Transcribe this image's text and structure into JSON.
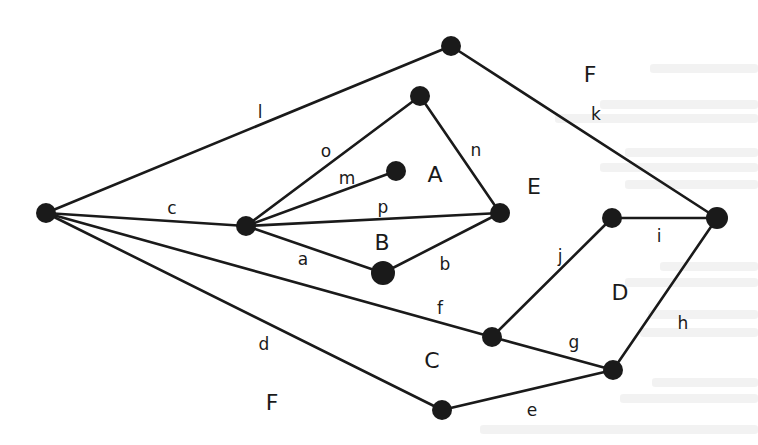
{
  "diagram": {
    "type": "planar-graph",
    "nodes": [
      {
        "id": "N1",
        "x": 46,
        "y": 213,
        "r": 10
      },
      {
        "id": "N2",
        "x": 246,
        "y": 226,
        "r": 10
      },
      {
        "id": "N3",
        "x": 451,
        "y": 46,
        "r": 10
      },
      {
        "id": "N4",
        "x": 420,
        "y": 96,
        "r": 10
      },
      {
        "id": "N5",
        "x": 396,
        "y": 171,
        "r": 10
      },
      {
        "id": "N6",
        "x": 500,
        "y": 213,
        "r": 10
      },
      {
        "id": "N7",
        "x": 383,
        "y": 273,
        "r": 12
      },
      {
        "id": "N8",
        "x": 612,
        "y": 218,
        "r": 10
      },
      {
        "id": "N9",
        "x": 717,
        "y": 218,
        "r": 11
      },
      {
        "id": "N10",
        "x": 492,
        "y": 337,
        "r": 10
      },
      {
        "id": "N11",
        "x": 613,
        "y": 370,
        "r": 10
      },
      {
        "id": "N12",
        "x": 442,
        "y": 410,
        "r": 10
      }
    ],
    "edges": [
      {
        "label": "l",
        "from": "N1",
        "to": "N3",
        "lx": 260,
        "ly": 118
      },
      {
        "label": "k",
        "from": "N3",
        "to": "N9",
        "lx": 596,
        "ly": 120
      },
      {
        "label": "c",
        "from": "N1",
        "to": "N2",
        "lx": 172,
        "ly": 214
      },
      {
        "label": "o",
        "from": "N2",
        "to": "N4",
        "lx": 326,
        "ly": 157
      },
      {
        "label": "m",
        "from": "N2",
        "to": "N5",
        "lx": 347,
        "ly": 184
      },
      {
        "label": "n",
        "from": "N4",
        "to": "N6",
        "lx": 476,
        "ly": 156
      },
      {
        "label": "p",
        "from": "N2",
        "to": "N6",
        "lx": 383,
        "ly": 213
      },
      {
        "label": "a",
        "from": "N2",
        "to": "N7",
        "lx": 303,
        "ly": 265
      },
      {
        "label": "b",
        "from": "N7",
        "to": "N6",
        "lx": 445,
        "ly": 270
      },
      {
        "label": "f",
        "from": "N1",
        "to": "N10",
        "lx": 440,
        "ly": 314
      },
      {
        "label": "d",
        "from": "N1",
        "to": "N12",
        "lx": 264,
        "ly": 350
      },
      {
        "label": "j",
        "from": "N10",
        "to": "N8",
        "lx": 560,
        "ly": 262
      },
      {
        "label": "i",
        "from": "N8",
        "to": "N9",
        "lx": 659,
        "ly": 242
      },
      {
        "label": "h",
        "from": "N9",
        "to": "N11",
        "lx": 683,
        "ly": 329
      },
      {
        "label": "g",
        "from": "N10",
        "to": "N11",
        "lx": 574,
        "ly": 348
      },
      {
        "label": "e",
        "from": "N12",
        "to": "N11",
        "lx": 532,
        "ly": 416
      }
    ],
    "faces": [
      {
        "label": "F",
        "x": 590,
        "y": 82
      },
      {
        "label": "A",
        "x": 435,
        "y": 182
      },
      {
        "label": "E",
        "x": 534,
        "y": 194
      },
      {
        "label": "B",
        "x": 382,
        "y": 250
      },
      {
        "label": "D",
        "x": 620,
        "y": 300
      },
      {
        "label": "C",
        "x": 432,
        "y": 368
      },
      {
        "label": "F",
        "x": 272,
        "y": 410
      }
    ],
    "stroke_color": "#1a1a1a",
    "background_color": "#ffffff"
  }
}
